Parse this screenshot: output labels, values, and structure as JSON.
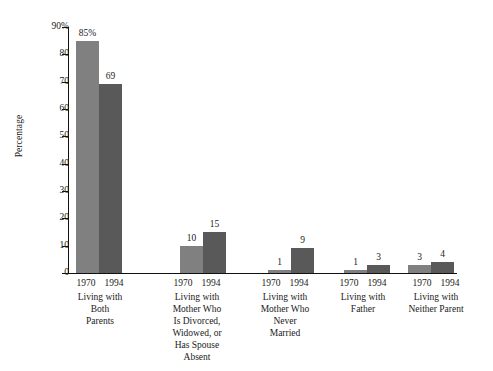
{
  "chart_data": {
    "type": "bar",
    "title": "",
    "subtitle": "",
    "xlabel": "",
    "ylabel": "Percentage",
    "ylim": [
      0,
      90
    ],
    "ytick_labels": [
      "90%",
      "80",
      "70",
      "60",
      "50",
      "40",
      "30",
      "20",
      "10",
      "0"
    ],
    "ytick_values": [
      90,
      80,
      70,
      60,
      50,
      40,
      30,
      20,
      10,
      0
    ],
    "grid": false,
    "legend": "none",
    "categories": [
      "Living with\nBoth\nParents",
      "Living with\nMother Who\nIs Divorced,\nWidowed, or\nHas Spouse\nAbsent",
      "Living with\nMother Who\nNever\nMarried",
      "Living with\nFather",
      "Living with\nNeither Parent"
    ],
    "series": [
      {
        "name": "1970",
        "color": "#808080",
        "values": [
          85,
          10,
          1,
          1,
          3
        ],
        "value_labels": [
          "85%",
          "10",
          "1",
          "1",
          "3"
        ]
      },
      {
        "name": "1994",
        "color": "#595959",
        "values": [
          69,
          15,
          9,
          3,
          4
        ],
        "value_labels": [
          "69",
          "15",
          "9",
          "3",
          "4"
        ]
      }
    ]
  },
  "axis": {
    "y_title": "Percentage"
  }
}
